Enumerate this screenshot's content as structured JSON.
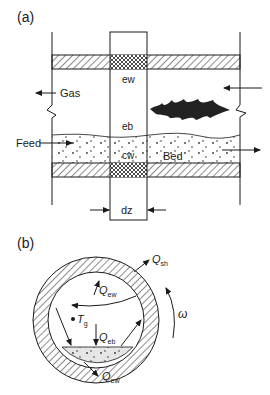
{
  "panel_a": {
    "label": "(a)",
    "labels": {
      "gas": "Gas",
      "feed": "Feed",
      "bed": "Bed",
      "ew": "ew",
      "eb": "eb",
      "cw": "cw",
      "dz": "dz"
    }
  },
  "panel_b": {
    "label": "(b)",
    "labels": {
      "q_sh": "Q",
      "q_sh_sub": "sh",
      "q_ew_top": "Q",
      "q_ew_top_sub": "ew",
      "q_eb": "Q",
      "q_eb_sub": "eb",
      "q_ew_bottom": "Q",
      "q_ew_bottom_sub": "ew",
      "t_g": "T",
      "t_g_sub": "g",
      "omega": "ω"
    }
  },
  "colors": {
    "line": "#1a1a1a",
    "bed_fill": "#e6e6e6",
    "flame": "#222222"
  }
}
